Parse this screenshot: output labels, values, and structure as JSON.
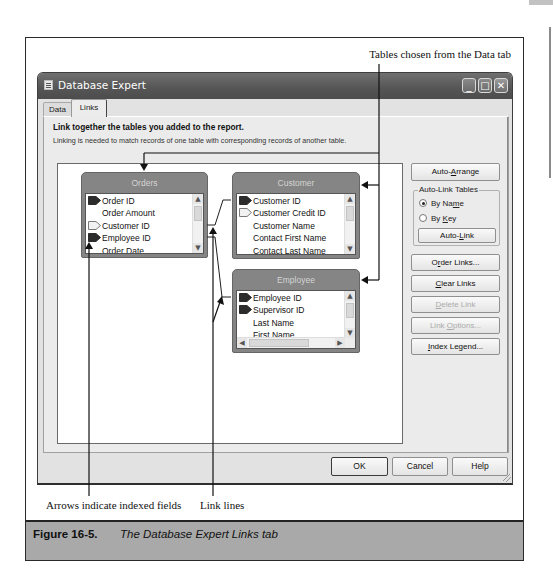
{
  "figure": {
    "caption_number": "Figure 16-5.",
    "caption_text": "The Database Expert Links tab"
  },
  "callouts": {
    "tables_chosen": "Tables chosen from the Data tab",
    "indexed_arrows": "Arrows indicate indexed fields",
    "link_lines": "Link lines"
  },
  "dialog": {
    "title": "Database Expert",
    "window_controls": {
      "minimize": "_",
      "maximize": "□",
      "close": "✕"
    },
    "tabs": [
      {
        "label": "Data",
        "active": false
      },
      {
        "label": "Links",
        "active": true
      }
    ],
    "heading": "Link together the tables you added to the report.",
    "subheading": "Linking is needed to match records of one table with corresponding records of another table.",
    "tables": [
      {
        "name": "Orders",
        "fields": [
          {
            "name": "Order ID",
            "index": "filled"
          },
          {
            "name": "Order Amount",
            "index": "none"
          },
          {
            "name": "Customer ID",
            "index": "outline"
          },
          {
            "name": "Employee ID",
            "index": "filled"
          },
          {
            "name": "Order Date",
            "index": "none"
          }
        ]
      },
      {
        "name": "Customer",
        "fields": [
          {
            "name": "Customer ID",
            "index": "filled"
          },
          {
            "name": "Customer Credit ID",
            "index": "outline"
          },
          {
            "name": "Customer Name",
            "index": "none"
          },
          {
            "name": "Contact First Name",
            "index": "none"
          },
          {
            "name": "Contact Last Name",
            "index": "none"
          }
        ]
      },
      {
        "name": "Employee",
        "fields": [
          {
            "name": "Employee ID",
            "index": "filled"
          },
          {
            "name": "Supervisor ID",
            "index": "filled"
          },
          {
            "name": "Last Name",
            "index": "none"
          },
          {
            "name": "First Name",
            "index": "none"
          }
        ]
      }
    ],
    "links": [
      {
        "from": "Orders.Customer ID",
        "to": "Customer.Customer ID"
      },
      {
        "from": "Orders.Employee ID",
        "to": "Employee.Employee ID"
      }
    ],
    "scroll_glyphs": {
      "up": "▲",
      "down": "▼",
      "left": "◀",
      "right": "▶"
    },
    "side_buttons": {
      "auto_arrange": {
        "pre": "Auto-",
        "key": "A",
        "post": "rrange",
        "enabled": true
      },
      "auto_link_group": {
        "title": "Auto-Link Tables",
        "by_name": {
          "pre": "By Na",
          "key": "m",
          "post": "e",
          "selected": true
        },
        "by_key": {
          "pre": "By ",
          "key": "K",
          "post": "ey",
          "selected": false
        },
        "auto_link": {
          "pre": "Auto-",
          "key": "L",
          "post": "ink",
          "enabled": true
        }
      },
      "order_links": {
        "pre": "O",
        "key": "r",
        "post": "der Links...",
        "enabled": true
      },
      "clear_links": {
        "pre": "",
        "key": "C",
        "post": "lear Links",
        "enabled": true
      },
      "delete_link": {
        "pre": "",
        "key": "D",
        "post": "elete Link",
        "enabled": false
      },
      "link_options": {
        "pre": "Link ",
        "key": "O",
        "post": "ptions...",
        "enabled": false
      },
      "index_legend": {
        "pre": "",
        "key": "I",
        "post": "ndex Legend...",
        "enabled": true
      }
    },
    "footer_buttons": {
      "ok": "OK",
      "cancel": "Cancel",
      "help": "Help"
    }
  },
  "colors": {
    "title_bar": "#555555",
    "dialog_body": "#e2e2e2",
    "table_header": "#858585",
    "caption_bar": "#a9a9a9",
    "disabled_text": "#ababab"
  }
}
